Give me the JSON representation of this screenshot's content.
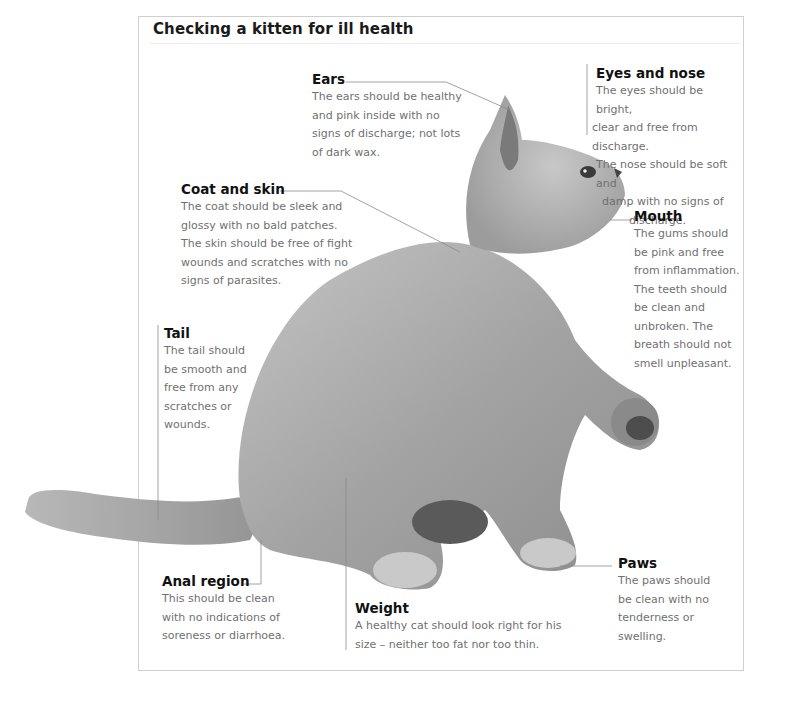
{
  "title": "Checking a kitten for ill health",
  "colors": {
    "heading": "#111111",
    "body_text": "#707070",
    "frame_border": "#cfcfcf",
    "leader_line": "#8a8a8a",
    "kitten_fur": "#9a9a9a"
  },
  "callouts": {
    "ears": {
      "heading": "Ears",
      "lines": [
        "The ears should be healthy",
        "and pink inside with no",
        "signs of discharge; not lots",
        "of dark wax."
      ]
    },
    "eyes_nose": {
      "heading": "Eyes and nose",
      "lines": [
        "The eyes should be bright,",
        "clear and free from discharge.",
        "The nose should be soft and",
        "damp with no signs of",
        "discharge."
      ]
    },
    "coat_skin": {
      "heading": "Coat and skin",
      "lines": [
        "The coat should be sleek and",
        "glossy with no bald patches.",
        "The skin should be free of fight",
        "wounds and scratches with no",
        "signs of parasites."
      ]
    },
    "mouth": {
      "heading": "Mouth",
      "lines": [
        "The gums should",
        "be pink and free",
        "from inflammation.",
        "The teeth should",
        "be clean and",
        "unbroken. The",
        "breath should not",
        "smell unpleasant."
      ]
    },
    "tail": {
      "heading": "Tail",
      "lines": [
        "The tail should",
        "be smooth and",
        "free from any",
        "scratches or",
        "wounds."
      ]
    },
    "anal_region": {
      "heading": "Anal region",
      "lines": [
        "This should be clean",
        "with no indications of",
        "soreness or diarrhoea."
      ]
    },
    "weight": {
      "heading": "Weight",
      "lines": [
        "A healthy cat should look right for his",
        "size – neither too fat nor too thin."
      ]
    },
    "paws": {
      "heading": "Paws",
      "lines": [
        "The paws should",
        "be clean with no",
        "tenderness or swelling."
      ]
    }
  }
}
